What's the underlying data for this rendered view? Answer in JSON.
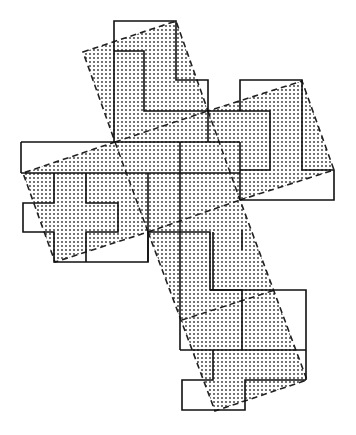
{
  "figure": {
    "title": "Dissection of a cross: tilted shaded cross overlaid on grid-aligned solid pieces",
    "stroke_color": "#222222",
    "fill_color": "#cfcfcf",
    "dot_color": "#333333",
    "background": "#ffffff"
  },
  "shaded_cross": {
    "outline": [
      [
        83,
        52
      ],
      [
        176,
        21
      ],
      [
        208,
        111
      ],
      [
        302,
        81
      ],
      [
        334,
        170
      ],
      [
        240,
        200
      ],
      [
        307,
        380
      ],
      [
        215,
        411
      ],
      [
        148,
        232
      ],
      [
        55,
        262
      ],
      [
        23,
        173
      ],
      [
        115,
        142
      ]
    ],
    "style": "dashed"
  },
  "solid_pieces": [
    {
      "name": "top-piece",
      "points": [
        [
          114,
          21
        ],
        [
          176,
          21
        ],
        [
          176,
          80
        ],
        [
          208,
          80
        ],
        [
          208,
          111
        ],
        [
          144,
          111
        ],
        [
          144,
          51
        ],
        [
          114,
          51
        ]
      ]
    },
    {
      "name": "top-piece-body",
      "points": [
        [
          114,
          51
        ],
        [
          144,
          51
        ],
        [
          144,
          111
        ],
        [
          208,
          111
        ],
        [
          208,
          142
        ],
        [
          114,
          142
        ]
      ]
    },
    {
      "name": "right-piece",
      "points": [
        [
          240,
          80
        ],
        [
          302,
          80
        ],
        [
          302,
          111
        ],
        [
          270,
          111
        ],
        [
          270,
          170
        ],
        [
          240,
          170
        ],
        [
          240,
          142
        ],
        [
          208,
          142
        ],
        [
          208,
          111
        ],
        [
          240,
          111
        ]
      ]
    },
    {
      "name": "right-piece-lower",
      "points": [
        [
          302,
          111
        ],
        [
          302,
          170
        ],
        [
          334,
          170
        ],
        [
          334,
          200
        ],
        [
          240,
          200
        ],
        [
          240,
          170
        ],
        [
          270,
          170
        ],
        [
          270,
          111
        ]
      ]
    },
    {
      "name": "left-piece",
      "points": [
        [
          21,
          142
        ],
        [
          115,
          142
        ],
        [
          115,
          173
        ],
        [
          23,
          173
        ]
      ]
    },
    {
      "name": "left-cross",
      "points": [
        [
          23,
          173
        ],
        [
          54,
          173
        ],
        [
          54,
          203
        ],
        [
          23,
          203
        ],
        [
          23,
          232
        ],
        [
          54,
          232
        ],
        [
          54,
          262
        ],
        [
          148,
          262
        ],
        [
          148,
          232
        ],
        [
          118,
          232
        ],
        [
          118,
          203
        ],
        [
          86,
          203
        ],
        [
          86,
          173
        ]
      ]
    },
    {
      "name": "center-piece",
      "points": [
        [
          86,
          173
        ],
        [
          148,
          173
        ],
        [
          148,
          232
        ],
        [
          180,
          232
        ],
        [
          180,
          262
        ],
        [
          148,
          262
        ]
      ]
    },
    {
      "name": "lower-piece",
      "points": [
        [
          180,
          232
        ],
        [
          210,
          232
        ],
        [
          210,
          290
        ],
        [
          242,
          290
        ],
        [
          242,
          320
        ],
        [
          180,
          320
        ]
      ]
    },
    {
      "name": "lower-right",
      "points": [
        [
          210,
          290
        ],
        [
          306,
          290
        ],
        [
          306,
          350
        ],
        [
          242,
          350
        ],
        [
          242,
          320
        ],
        [
          210,
          320
        ]
      ]
    },
    {
      "name": "bottom-piece",
      "points": [
        [
          182,
          350
        ],
        [
          306,
          350
        ],
        [
          306,
          380
        ],
        [
          245,
          380
        ],
        [
          245,
          410
        ],
        [
          182,
          410
        ],
        [
          182,
          380
        ],
        [
          213,
          380
        ]
      ]
    }
  ]
}
